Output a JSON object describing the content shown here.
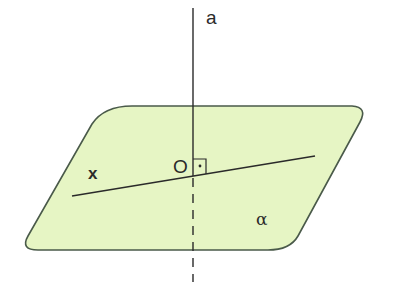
{
  "diagram": {
    "plane": {
      "label": "α",
      "fill": "#e6f5c4",
      "stroke": "#4a5a4a"
    },
    "line_a": {
      "label": "a",
      "color": "#2a2a2a"
    },
    "line_x": {
      "label": "x",
      "color": "#2a2a2a"
    },
    "point": {
      "label": "O"
    },
    "right_angle_marker": true
  }
}
